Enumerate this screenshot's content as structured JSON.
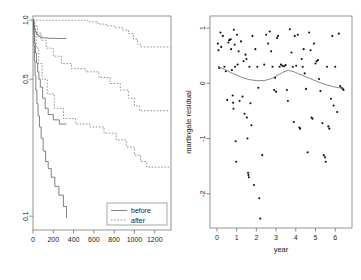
{
  "figure": {
    "panels": [
      "survival-plot",
      "residual-plot"
    ]
  },
  "chart_data": [
    {
      "type": "line",
      "name": "survival-plot",
      "title": "",
      "xlabel": "",
      "ylabel": "",
      "xlim": [
        0,
        1360
      ],
      "ylim": [
        0.085,
        1.05
      ],
      "yscale": "log",
      "grid": false,
      "xticks": [
        0,
        200,
        400,
        600,
        800,
        1000,
        1200
      ],
      "xticklabels": [
        "0",
        "200",
        "400",
        "600",
        "800",
        "1000",
        "1200"
      ],
      "yticks": [
        1.0,
        0.5,
        0.1
      ],
      "yticklabels": [
        "1.0",
        "0.5",
        "0.1"
      ],
      "legend": {
        "position": "bottom-right",
        "entries": [
          {
            "label": "before",
            "style": "solid"
          },
          {
            "label": "after",
            "style": "dashed"
          }
        ]
      },
      "series": [
        {
          "name": "before-group-1",
          "style": "solid",
          "steps": [
            [
              0,
              1.0
            ],
            [
              6,
              0.97
            ],
            [
              12,
              0.93
            ],
            [
              18,
              0.9
            ],
            [
              26,
              0.87
            ],
            [
              36,
              0.845
            ],
            [
              50,
              0.828
            ],
            [
              70,
              0.818
            ],
            [
              100,
              0.812
            ],
            [
              150,
              0.808
            ],
            [
              230,
              0.806
            ],
            [
              330,
              0.806
            ]
          ]
        },
        {
          "name": "before-group-2",
          "style": "solid",
          "steps": [
            [
              0,
              1.0
            ],
            [
              5,
              0.93
            ],
            [
              10,
              0.84
            ],
            [
              16,
              0.76
            ],
            [
              24,
              0.68
            ],
            [
              34,
              0.605
            ],
            [
              46,
              0.545
            ],
            [
              58,
              0.5
            ],
            [
              72,
              0.455
            ],
            [
              95,
              0.4
            ],
            [
              120,
              0.355
            ],
            [
              150,
              0.33
            ],
            [
              200,
              0.31
            ],
            [
              260,
              0.295
            ],
            [
              330,
              0.295
            ]
          ]
        },
        {
          "name": "before-group-3",
          "style": "solid",
          "steps": [
            [
              0,
              1.0
            ],
            [
              4,
              0.88
            ],
            [
              9,
              0.74
            ],
            [
              14,
              0.62
            ],
            [
              20,
              0.52
            ],
            [
              28,
              0.44
            ],
            [
              38,
              0.375
            ],
            [
              50,
              0.325
            ],
            [
              64,
              0.285
            ],
            [
              80,
              0.25
            ],
            [
              100,
              0.215
            ],
            [
              124,
              0.19
            ],
            [
              150,
              0.175
            ],
            [
              180,
              0.158
            ],
            [
              215,
              0.142
            ],
            [
              255,
              0.128
            ],
            [
              300,
              0.112
            ],
            [
              330,
              0.098
            ]
          ]
        },
        {
          "name": "after-group-1",
          "style": "dashed",
          "steps": [
            [
              0,
              1.0
            ],
            [
              420,
              1.0
            ],
            [
              540,
              0.98
            ],
            [
              640,
              0.955
            ],
            [
              720,
              0.935
            ],
            [
              800,
              0.915
            ],
            [
              880,
              0.89
            ],
            [
              940,
              0.855
            ],
            [
              990,
              0.8
            ],
            [
              1030,
              0.755
            ],
            [
              1060,
              0.73
            ],
            [
              1350,
              0.73
            ]
          ]
        },
        {
          "name": "after-group-2",
          "style": "dashed",
          "steps": [
            [
              0,
              1.0
            ],
            [
              20,
              0.93
            ],
            [
              45,
              0.86
            ],
            [
              80,
              0.79
            ],
            [
              130,
              0.72
            ],
            [
              200,
              0.655
            ],
            [
              280,
              0.6
            ],
            [
              380,
              0.565
            ],
            [
              520,
              0.545
            ],
            [
              650,
              0.51
            ],
            [
              760,
              0.475
            ],
            [
              860,
              0.44
            ],
            [
              940,
              0.4
            ],
            [
              1000,
              0.365
            ],
            [
              1050,
              0.345
            ],
            [
              1350,
              0.345
            ]
          ]
        },
        {
          "name": "after-group-3",
          "style": "dashed",
          "steps": [
            [
              0,
              1.0
            ],
            [
              14,
              0.86
            ],
            [
              32,
              0.72
            ],
            [
              56,
              0.6
            ],
            [
              90,
              0.5
            ],
            [
              140,
              0.42
            ],
            [
              210,
              0.355
            ],
            [
              300,
              0.315
            ],
            [
              420,
              0.295
            ],
            [
              560,
              0.285
            ],
            [
              700,
              0.265
            ],
            [
              820,
              0.245
            ],
            [
              920,
              0.225
            ],
            [
              1000,
              0.205
            ],
            [
              1060,
              0.19
            ],
            [
              1120,
              0.178
            ],
            [
              1350,
              0.178
            ]
          ]
        }
      ]
    },
    {
      "type": "scatter",
      "name": "residual-plot",
      "title": "",
      "xlabel": "year",
      "ylabel": "martingale residual",
      "xlim": [
        -0.35,
        6.85
      ],
      "ylim": [
        -2.62,
        1.22
      ],
      "grid": false,
      "xticks": [
        0,
        1,
        2,
        3,
        4,
        5,
        6
      ],
      "xticklabels": [
        "0",
        "1",
        "2",
        "3",
        "4",
        "5",
        "6"
      ],
      "yticks": [
        1,
        0,
        -1,
        -2
      ],
      "yticklabels": [
        "1",
        "0",
        "-1",
        "-2"
      ],
      "points": [
        [
          0.05,
          0.72
        ],
        [
          0.08,
          0.6
        ],
        [
          0.12,
          0.28
        ],
        [
          0.18,
          0.92
        ],
        [
          0.22,
          0.66
        ],
        [
          0.3,
          0.86
        ],
        [
          0.38,
          0.3
        ],
        [
          0.45,
          0.22
        ],
        [
          0.52,
          -0.3
        ],
        [
          0.58,
          0.74
        ],
        [
          0.62,
          0.78
        ],
        [
          0.66,
          0.79
        ],
        [
          0.7,
          0.8
        ],
        [
          0.72,
          0.62
        ],
        [
          0.76,
          0.24
        ],
        [
          0.8,
          -0.22
        ],
        [
          0.82,
          -0.35
        ],
        [
          0.84,
          -0.46
        ],
        [
          0.86,
          0.97
        ],
        [
          0.9,
          0.7
        ],
        [
          0.92,
          0.3
        ],
        [
          0.95,
          -1.05
        ],
        [
          0.98,
          -1.42
        ],
        [
          1.02,
          0.88
        ],
        [
          1.05,
          0.34
        ],
        [
          1.1,
          0.58
        ],
        [
          1.15,
          -0.32
        ],
        [
          1.22,
          0.76
        ],
        [
          1.3,
          -0.24
        ],
        [
          1.35,
          0.4
        ],
        [
          1.4,
          -0.55
        ],
        [
          1.45,
          0.52
        ],
        [
          1.5,
          0.44
        ],
        [
          1.52,
          -0.62
        ],
        [
          1.55,
          -1.0
        ],
        [
          1.58,
          -1.62
        ],
        [
          1.6,
          -1.66
        ],
        [
          1.62,
          -1.7
        ],
        [
          1.65,
          0.3
        ],
        [
          1.7,
          -0.36
        ],
        [
          1.75,
          -0.76
        ],
        [
          1.8,
          0.86
        ],
        [
          1.88,
          -1.84
        ],
        [
          1.95,
          0.62
        ],
        [
          2.05,
          0.3
        ],
        [
          2.1,
          -0.08
        ],
        [
          2.15,
          -2.08
        ],
        [
          2.2,
          -2.45
        ],
        [
          2.3,
          -1.3
        ],
        [
          2.4,
          0.34
        ],
        [
          2.5,
          0.88
        ],
        [
          2.6,
          0.72
        ],
        [
          2.68,
          0.94
        ],
        [
          2.75,
          0.58
        ],
        [
          2.82,
          0.3
        ],
        [
          2.9,
          -0.12
        ],
        [
          2.95,
          0.1
        ],
        [
          3.0,
          -0.15
        ],
        [
          3.05,
          0.82
        ],
        [
          3.1,
          0.86
        ],
        [
          3.18,
          0.3
        ],
        [
          3.25,
          0.34
        ],
        [
          3.32,
          0.32
        ],
        [
          3.4,
          0.31
        ],
        [
          3.48,
          0.33
        ],
        [
          3.55,
          -0.12
        ],
        [
          3.6,
          -0.32
        ],
        [
          3.7,
          0.98
        ],
        [
          3.78,
          0.56
        ],
        [
          3.85,
          0.3
        ],
        [
          3.9,
          -0.7
        ],
        [
          3.95,
          0.86
        ],
        [
          4.02,
          0.32
        ],
        [
          4.1,
          0.88
        ],
        [
          4.18,
          -0.8
        ],
        [
          4.22,
          -0.82
        ],
        [
          4.3,
          0.44
        ],
        [
          4.35,
          0.3
        ],
        [
          4.4,
          0.62
        ],
        [
          4.45,
          0.18
        ],
        [
          4.52,
          -0.1
        ],
        [
          4.6,
          -1.25
        ],
        [
          4.68,
          0.92
        ],
        [
          4.75,
          0.6
        ],
        [
          4.8,
          -0.62
        ],
        [
          4.85,
          -0.64
        ],
        [
          4.92,
          0.72
        ],
        [
          5.0,
          0.36
        ],
        [
          5.05,
          0.4
        ],
        [
          5.12,
          0.42
        ],
        [
          5.18,
          0.08
        ],
        [
          5.25,
          -0.14
        ],
        [
          5.35,
          -0.72
        ],
        [
          5.42,
          -1.3
        ],
        [
          5.48,
          -1.34
        ],
        [
          5.52,
          -1.42
        ],
        [
          5.58,
          0.3
        ],
        [
          5.65,
          -0.78
        ],
        [
          5.7,
          -0.82
        ],
        [
          5.78,
          -0.28
        ],
        [
          5.85,
          0.86
        ],
        [
          5.92,
          -0.4
        ],
        [
          6.0,
          0.3
        ],
        [
          6.1,
          -0.52
        ],
        [
          6.18,
          0.9
        ],
        [
          6.25,
          -0.05
        ],
        [
          6.32,
          -0.08
        ],
        [
          6.38,
          -0.1
        ],
        [
          6.42,
          -0.12
        ]
      ],
      "smoother": {
        "name": "lowess",
        "x": [
          0.05,
          0.4,
          0.8,
          1.2,
          1.6,
          2.0,
          2.4,
          2.8,
          3.1,
          3.4,
          3.62,
          3.9,
          4.3,
          4.7,
          5.1,
          5.5,
          5.9,
          6.2,
          6.42
        ],
        "y": [
          0.31,
          0.25,
          0.18,
          0.12,
          0.07,
          0.05,
          0.05,
          0.09,
          0.15,
          0.21,
          0.235,
          0.21,
          0.15,
          0.09,
          0.03,
          -0.02,
          -0.06,
          -0.08,
          -0.09
        ]
      }
    }
  ]
}
